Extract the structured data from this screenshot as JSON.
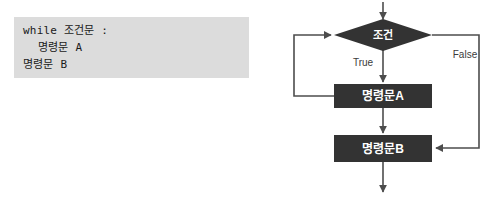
{
  "code_block": {
    "lines": [
      {
        "text": "while 조건문 :",
        "indent": 0
      },
      {
        "text": "명령문 A",
        "indent": 1
      },
      {
        "text": "명령문 B",
        "indent": 0
      }
    ],
    "background_color": "#dcdcdc",
    "text_color": "#1a1a1a"
  },
  "flowchart": {
    "title": "while loop flowchart",
    "node_fill_color": "#333333",
    "node_text_color": "#ffffff",
    "edge_color": "#4d4d4d",
    "nodes": {
      "condition": {
        "label": "조건",
        "shape": "diamond"
      },
      "statement_a": {
        "label": "명령문A",
        "shape": "rectangle"
      },
      "statement_b": {
        "label": "명령문B",
        "shape": "rectangle"
      }
    },
    "edges": {
      "true_label": "True",
      "false_label": "False"
    }
  }
}
